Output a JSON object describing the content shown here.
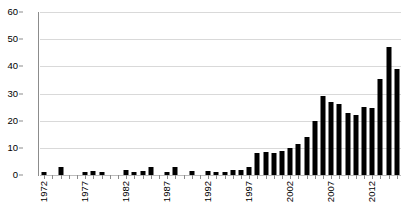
{
  "chart_data": {
    "type": "bar",
    "title": "",
    "subtitle": "",
    "xlabel": "",
    "ylabel": "",
    "grid": "horizontal",
    "legend": "none",
    "bar_color": "#000000",
    "gridline_color": "#d9d9d9",
    "axis_color": "#8c8c8c",
    "background": "#ffffff",
    "ylim": [
      0,
      60
    ],
    "yticks": [
      0,
      10,
      20,
      30,
      40,
      50,
      60
    ],
    "ytick_labels": [
      "0",
      "10",
      "20",
      "30",
      "40",
      "50",
      "60"
    ],
    "xtick_labels": [
      "1972",
      "1977",
      "1982",
      "1987",
      "1992",
      "1997",
      "2002",
      "2007",
      "2012"
    ],
    "xtick_label_rotation": 90,
    "xtick_every": 5,
    "categories": [
      "1972",
      "1973",
      "1974",
      "1975",
      "1976",
      "1977",
      "1978",
      "1979",
      "1980",
      "1981",
      "1982",
      "1983",
      "1984",
      "1985",
      "1986",
      "1987",
      "1988",
      "1989",
      "1990",
      "1991",
      "1992",
      "1993",
      "1994",
      "1995",
      "1996",
      "1997",
      "1998",
      "1999",
      "2000",
      "2001",
      "2002",
      "2003",
      "2004",
      "2005",
      "2006",
      "2007",
      "2008",
      "2009",
      "2010",
      "2011",
      "2012",
      "2013",
      "2014"
    ],
    "values": [
      1,
      0,
      3,
      0,
      0,
      1,
      1.5,
      1,
      0,
      0,
      2,
      1,
      1.5,
      3,
      0,
      1,
      3,
      0,
      1.5,
      0,
      1.5,
      1,
      1,
      2,
      2,
      3,
      8,
      8.5,
      8,
      9,
      10,
      11.5,
      14,
      20,
      29,
      27,
      26,
      23,
      22,
      25,
      24.5,
      35.5,
      47
    ],
    "last_value": 39,
    "series_note": "annual counts"
  }
}
